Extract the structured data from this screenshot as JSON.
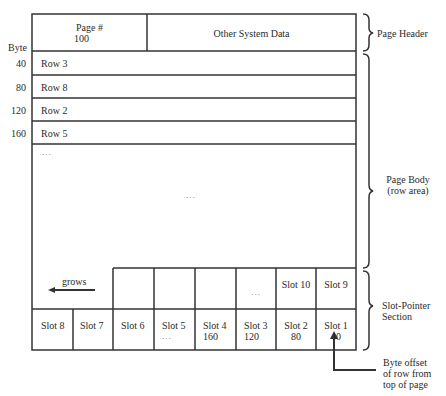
{
  "header": {
    "page_num_label": "Page #",
    "page_num_value": "100",
    "other_label": "Other System Data"
  },
  "byte_axis": {
    "label": "Byte",
    "ticks": [
      "40",
      "80",
      "120",
      "160"
    ]
  },
  "rows": [
    "Row 3",
    "Row 8",
    "Row 2",
    "Row 5"
  ],
  "body": {
    "ellipsis_left": "...",
    "ellipsis_center": "..."
  },
  "slots_upper": [
    {
      "label": ""
    },
    {
      "label": ""
    },
    {
      "label": ""
    },
    {
      "label": "..."
    },
    {
      "label": "Slot 10"
    },
    {
      "label": "Slot 9"
    }
  ],
  "slots_lower": [
    {
      "label": "Slot 8",
      "value": ""
    },
    {
      "label": "Slot 7",
      "value": ""
    },
    {
      "label": "Slot 6",
      "value": ""
    },
    {
      "label": "Slot 5",
      "value": "..."
    },
    {
      "label": "Slot 4",
      "value": "160"
    },
    {
      "label": "Slot 3",
      "value": "120"
    },
    {
      "label": "Slot 2",
      "value": "80"
    },
    {
      "label": "Slot 1",
      "value": "40"
    }
  ],
  "grows_label": "grows",
  "annotations": {
    "page_header": "Page Header",
    "page_body_1": "Page Body",
    "page_body_2": "(row area)",
    "slot_section_1": "Slot-Pointer",
    "slot_section_2": "Section",
    "byte_offset_1": "Byte offset",
    "byte_offset_2": "of row from",
    "byte_offset_3": "top of page"
  }
}
